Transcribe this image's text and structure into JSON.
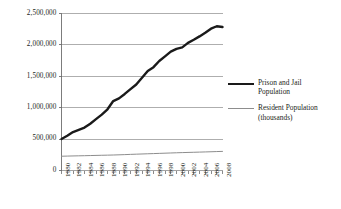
{
  "chart_data": {
    "type": "line",
    "title": "",
    "subtitle": "",
    "xlabel": "",
    "ylabel": "",
    "ylim": [
      0,
      2500000
    ],
    "xlim": [
      1980,
      2008
    ],
    "grid": true,
    "grid_axis": "y",
    "legend_position": "right",
    "y_ticks": [
      0,
      500000,
      1000000,
      1500000,
      2000000,
      2500000
    ],
    "y_tick_labels": [
      "0",
      "500,000",
      "1,000,000",
      "1,500,000",
      "2,000,000",
      "2,500,000"
    ],
    "x": [
      1980,
      1981,
      1982,
      1983,
      1984,
      1985,
      1986,
      1987,
      1988,
      1989,
      1990,
      1991,
      1992,
      1993,
      1994,
      1995,
      1996,
      1997,
      1998,
      1999,
      2000,
      2001,
      2002,
      2003,
      2004,
      2005,
      2006,
      2007,
      2008
    ],
    "x_tick_labels": [
      "1980",
      "1982",
      "1984",
      "1986",
      "1988",
      "1990",
      "1992",
      "1994",
      "1996",
      "1998",
      "2000",
      "2002",
      "2004",
      "2006",
      "2008"
    ],
    "x_tick_step_years": 2,
    "series": [
      {
        "name": "Prison and Jail Population",
        "color": "#1a1a1a",
        "line_width": 2.4,
        "values": [
          501886,
          553000,
          612000,
          647000,
          683000,
          745000,
          818000,
          890000,
          975000,
          1106000,
          1148702,
          1219014,
          1295150,
          1369185,
          1476621,
          1585586,
          1646020,
          1743643,
          1816931,
          1893115,
          1937482,
          1961247,
          2033022,
          2081580,
          2135335,
          2193798,
          2258792,
          2296800,
          2284000
        ]
      },
      {
        "name": "Resident Population (thousands)",
        "color": "#8d8d8d",
        "line_width": 1,
        "values": [
          227225,
          229466,
          231664,
          233792,
          235825,
          237924,
          240133,
          242289,
          244499,
          246819,
          249623,
          252981,
          256514,
          259919,
          263126,
          266278,
          269394,
          272647,
          275854,
          279040,
          282172,
          285082,
          287804,
          290326,
          293046,
          295753,
          298593,
          301580,
          304375
        ]
      }
    ]
  },
  "legend": {
    "entries": [
      {
        "label_line1": "Prison and Jail",
        "label_line2": "Population",
        "style": "thick"
      },
      {
        "label_line1": "Resident Population",
        "label_line2": "(thousands)",
        "style": "thin"
      }
    ]
  }
}
